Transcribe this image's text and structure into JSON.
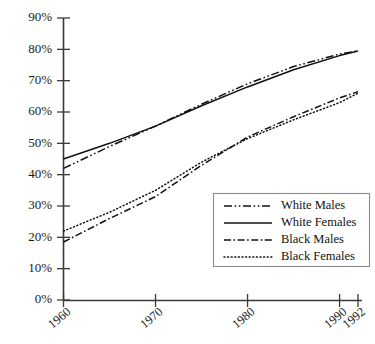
{
  "chart_data": {
    "type": "line",
    "title": "",
    "subtitle": "",
    "xlabel": "",
    "ylabel": "",
    "xlim": [
      1960,
      1992
    ],
    "ylim": [
      0,
      90
    ],
    "grid": false,
    "legend_position": "bottom-right",
    "x_ticks": [
      1960,
      1970,
      1980,
      1990,
      1992
    ],
    "x_tick_labels": [
      "1960",
      "1970",
      "1980",
      "1990",
      "1992"
    ],
    "y_ticks": [
      0,
      10,
      20,
      30,
      40,
      50,
      60,
      70,
      80,
      90
    ],
    "y_tick_labels": [
      "0%",
      "10%",
      "20%",
      "30%",
      "40%",
      "50%",
      "60%",
      "70%",
      "80%",
      "90%"
    ],
    "x": [
      1960,
      1965,
      1970,
      1975,
      1980,
      1985,
      1990,
      1992
    ],
    "series": [
      {
        "name": "White Males",
        "line_style": "dash-dot-dot",
        "color": "#111111",
        "values": [
          42.0,
          49.0,
          55.5,
          62.5,
          69.0,
          74.5,
          78.5,
          79.5
        ]
      },
      {
        "name": "White Females",
        "line_style": "solid",
        "color": "#111111",
        "values": [
          45.0,
          50.0,
          55.5,
          62.0,
          68.0,
          73.5,
          78.0,
          79.5
        ]
      },
      {
        "name": "Black Males",
        "line_style": "dash-dot",
        "color": "#111111",
        "values": [
          18.5,
          26.0,
          33.0,
          43.0,
          52.0,
          58.5,
          64.5,
          66.5
        ]
      },
      {
        "name": "Black Females",
        "line_style": "dotted",
        "color": "#111111",
        "values": [
          22.0,
          28.0,
          35.0,
          44.0,
          51.5,
          57.5,
          63.0,
          66.0
        ]
      }
    ]
  },
  "legend": {
    "entries": [
      {
        "label": "White Males"
      },
      {
        "label": "White Females"
      },
      {
        "label": "Black Males"
      },
      {
        "label": "Black Females"
      }
    ]
  }
}
